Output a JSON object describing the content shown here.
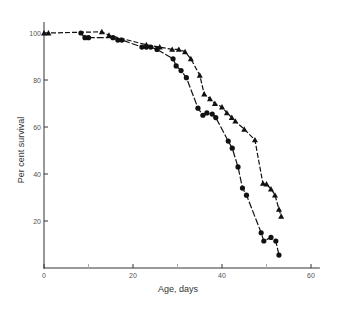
{
  "chart_data": {
    "type": "line",
    "title": "",
    "xlabel": "Age, days",
    "ylabel": "Per cent survival",
    "xlim": [
      0,
      62
    ],
    "ylim": [
      0,
      105
    ],
    "x_ticks": [
      0,
      20,
      40,
      60
    ],
    "x_minor_ticks": [
      10,
      30,
      50
    ],
    "y_ticks": [
      20,
      40,
      60,
      80,
      100
    ],
    "grid": false,
    "legend": "none",
    "series": [
      {
        "name": "circles",
        "marker": "circle",
        "points": [
          [
            8.3,
            100
          ],
          [
            9.2,
            98
          ],
          [
            10,
            98
          ],
          [
            15.5,
            98
          ],
          [
            16.6,
            97
          ],
          [
            17.5,
            97
          ],
          [
            22,
            94
          ],
          [
            23,
            94
          ],
          [
            24,
            94
          ],
          [
            25.4,
            93
          ],
          [
            29,
            89
          ],
          [
            29.7,
            86
          ],
          [
            30.8,
            84
          ],
          [
            32,
            81
          ],
          [
            34.6,
            68
          ],
          [
            35.7,
            65
          ],
          [
            36.6,
            66
          ],
          [
            37.8,
            65.5
          ],
          [
            38.6,
            64
          ],
          [
            41.4,
            54
          ],
          [
            42.3,
            51
          ],
          [
            43.6,
            43
          ],
          [
            44.6,
            34
          ],
          [
            45.5,
            31
          ],
          [
            48.8,
            15
          ],
          [
            49.4,
            11.5
          ],
          [
            51,
            13
          ],
          [
            52.1,
            11.5
          ],
          [
            52.8,
            5.5
          ]
        ]
      },
      {
        "name": "triangles",
        "marker": "triangle",
        "points": [
          [
            0,
            100
          ],
          [
            1,
            100
          ],
          [
            13,
            100.5
          ],
          [
            14.6,
            99
          ],
          [
            23,
            95
          ],
          [
            26,
            94
          ],
          [
            28.8,
            93
          ],
          [
            30.3,
            93
          ],
          [
            31.7,
            92
          ],
          [
            33,
            89
          ],
          [
            35,
            82
          ],
          [
            36,
            74
          ],
          [
            37.3,
            72
          ],
          [
            38.4,
            70
          ],
          [
            40,
            68.5
          ],
          [
            41.1,
            66
          ],
          [
            42.2,
            64
          ],
          [
            43,
            62.5
          ],
          [
            45,
            59
          ],
          [
            47.4,
            54.5
          ],
          [
            49.2,
            36
          ],
          [
            50,
            35.7
          ],
          [
            51,
            33.6
          ],
          [
            51.9,
            31
          ],
          [
            52.8,
            25
          ],
          [
            53.3,
            22
          ]
        ]
      }
    ]
  }
}
